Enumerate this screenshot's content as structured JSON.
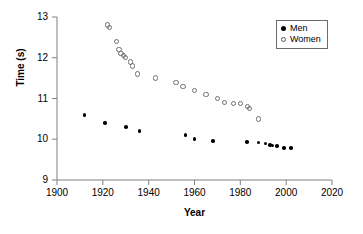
{
  "chart_data": {
    "type": "scatter",
    "title": "",
    "xlabel": "Year",
    "ylabel": "Time (s)",
    "xlim": [
      1900,
      2020
    ],
    "ylim": [
      9,
      13
    ],
    "xticks": [
      1900,
      1920,
      1940,
      1960,
      1980,
      2000,
      2020
    ],
    "yticks": [
      9,
      10,
      11,
      12,
      13
    ],
    "grid": false,
    "legend_position": "top-right",
    "series": [
      {
        "name": "Men",
        "marker": "filled-circle",
        "color": "#000000",
        "points": [
          [
            1912,
            10.6
          ],
          [
            1921,
            10.4
          ],
          [
            1930,
            10.3
          ],
          [
            1936,
            10.2
          ],
          [
            1956,
            10.1
          ],
          [
            1960,
            10.0
          ],
          [
            1968,
            9.95
          ],
          [
            1983,
            9.93
          ],
          [
            1988,
            9.92
          ],
          [
            1991,
            9.9
          ],
          [
            1993,
            9.86
          ],
          [
            1994,
            9.85
          ],
          [
            1996,
            9.84
          ],
          [
            1999,
            9.79
          ],
          [
            2002,
            9.78
          ]
        ]
      },
      {
        "name": "Women",
        "marker": "open-circle",
        "color": "#6e6e6e",
        "points": [
          [
            1922,
            12.8
          ],
          [
            1923,
            12.75
          ],
          [
            1926,
            12.4
          ],
          [
            1927,
            12.2
          ],
          [
            1928,
            12.1
          ],
          [
            1929,
            12.05
          ],
          [
            1930,
            12.0
          ],
          [
            1932,
            11.9
          ],
          [
            1933,
            11.8
          ],
          [
            1935,
            11.6
          ],
          [
            1943,
            11.5
          ],
          [
            1952,
            11.4
          ],
          [
            1955,
            11.3
          ],
          [
            1960,
            11.2
          ],
          [
            1965,
            11.1
          ],
          [
            1970,
            11.0
          ],
          [
            1973,
            10.9
          ],
          [
            1977,
            10.88
          ],
          [
            1980,
            10.88
          ],
          [
            1983,
            10.8
          ],
          [
            1984,
            10.76
          ],
          [
            1988,
            10.5
          ]
        ]
      }
    ]
  },
  "legend": {
    "entries": [
      {
        "label": "Men"
      },
      {
        "label": "Women"
      }
    ]
  }
}
